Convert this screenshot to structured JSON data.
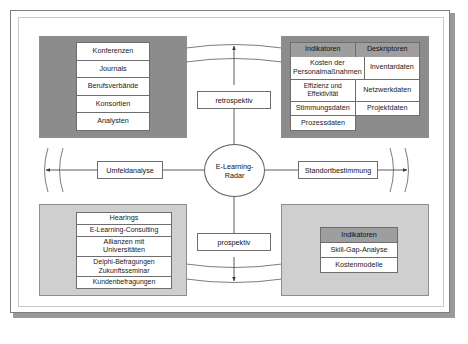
{
  "diagram": {
    "center_node": "E-Learning-\nRadar",
    "axes": {
      "top": "retrospektiv",
      "bottom": "prospektiv",
      "left": "Umfeldanalyse",
      "right": "Standortbestimmung"
    },
    "quadrants": {
      "top_left": {
        "shade": "dark",
        "columns": [],
        "rows": [
          [
            "Konferenzen"
          ],
          [
            "Journals"
          ],
          [
            "Berufsverbände"
          ],
          [
            "Konsortien"
          ],
          [
            "Analysten"
          ]
        ]
      },
      "top_right": {
        "shade": "dark",
        "columns": [
          "Indikatoren",
          "Deskriptoren"
        ],
        "rows": [
          [
            "Kosten der\nPersonalmaßnahmen",
            "Inventardaten"
          ],
          [
            "Effizienz und Effektivität",
            "Netzwerkdaten"
          ],
          [
            "Stimmungsdaten",
            "Projektdaten"
          ],
          [
            "Prozessdaten",
            ""
          ]
        ]
      },
      "bottom_left": {
        "shade": "light",
        "columns": [],
        "rows": [
          [
            "Hearings"
          ],
          [
            "E-Learning-Consulting"
          ],
          [
            "Allianzen mit\nUniversitäten"
          ],
          [
            "Delphi-Befragungen\nZukunftsseminar"
          ],
          [
            "Kundenbefragungen"
          ]
        ]
      },
      "bottom_right": {
        "shade": "light",
        "columns": [
          "Indikatoren"
        ],
        "rows": [
          [
            "Skill-Gap-Analyse"
          ],
          [
            "Kostenmodelle"
          ]
        ]
      }
    },
    "colors": {
      "panel_dark": "#8c8c8c",
      "panel_light": "#cfcfcf",
      "header_fill": "#9e9e9e",
      "line": "#6e6e6e",
      "frame_border": "#7d7d7d",
      "shadow": "#9a9a9a",
      "text": "#1a1a1a"
    }
  }
}
